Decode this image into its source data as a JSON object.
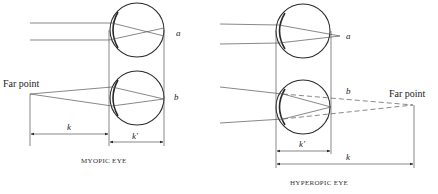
{
  "diagram": {
    "myopic": {
      "caption": "MYOPIC EYE",
      "far_point_label": "Far point",
      "label_a": "a",
      "label_b": "b",
      "dim_k": "k",
      "dim_k_prime": "k'"
    },
    "hyperopic": {
      "caption": "HYPEROPIC EYE",
      "far_point_label": "Far point",
      "label_a": "a",
      "label_b": "b",
      "dim_k": "k",
      "dim_k_prime": "k'"
    },
    "colors": {
      "ink": "#2a2a2a",
      "background": "#ffffff"
    }
  }
}
